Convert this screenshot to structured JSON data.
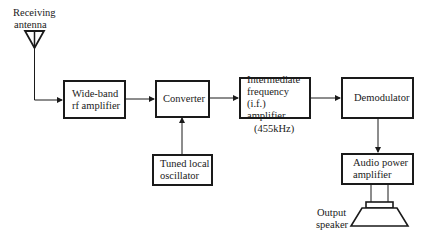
{
  "diagram": {
    "antenna_label": "Receiving\nantenna",
    "antenna_label_line1": "Receiving",
    "antenna_label_line2": "antenna",
    "blocks": [
      {
        "id": "rf_amp",
        "label": "Wide-band\nrf amplifier"
      },
      {
        "id": "converter",
        "label": "Converter"
      },
      {
        "id": "if_amp",
        "label": "Intermediate\nfrequency (i.f.)\namplifier"
      },
      {
        "id": "demodulator",
        "label": "Demodulator"
      },
      {
        "id": "local_osc",
        "label": "Tuned local\noscillator"
      },
      {
        "id": "audio_amp",
        "label": "Audio power\namplifier"
      }
    ],
    "if_frequency_note": "(455kHz)",
    "speaker_label_line1": "Output",
    "speaker_label_line2": "speaker",
    "connections": [
      {
        "from": "antenna",
        "to": "rf_amp"
      },
      {
        "from": "rf_amp",
        "to": "converter"
      },
      {
        "from": "local_osc",
        "to": "converter"
      },
      {
        "from": "converter",
        "to": "if_amp"
      },
      {
        "from": "if_amp",
        "to": "demodulator"
      },
      {
        "from": "demodulator",
        "to": "audio_amp"
      },
      {
        "from": "audio_amp",
        "to": "speaker"
      }
    ],
    "colors": {
      "line": "#1a1a1a",
      "background": "#ffffff"
    }
  }
}
